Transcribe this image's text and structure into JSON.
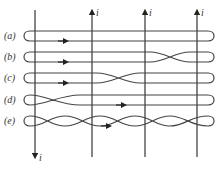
{
  "figure": {
    "wires": [
      {
        "x": 35,
        "current_label": "i",
        "direction": "down"
      },
      {
        "x": 92,
        "current_label": "i",
        "direction": "up"
      },
      {
        "x": 145,
        "current_label": "i",
        "direction": "up"
      },
      {
        "x": 197,
        "current_label": "i",
        "direction": "up"
      }
    ],
    "loops": [
      {
        "label": "(a)",
        "y": 36,
        "twists": "none"
      },
      {
        "label": "(b)",
        "y": 57,
        "twists": "between wires 3 and 4"
      },
      {
        "label": "(c)",
        "y": 78,
        "twists": "between wires 2 and 3"
      },
      {
        "label": "(d)",
        "y": 100,
        "twists": "between wires 1 and 2"
      },
      {
        "label": "(e)",
        "y": 121,
        "twists": "in every segment"
      }
    ],
    "colors": {
      "line": "#444444",
      "background": "#ffffff"
    }
  }
}
